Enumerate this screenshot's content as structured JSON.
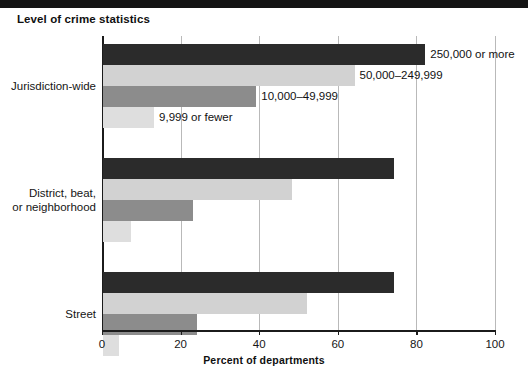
{
  "figure": {
    "title": "Level of crime statistics",
    "top_rule_color": "#141414"
  },
  "chart_data": {
    "type": "bar",
    "orientation": "horizontal",
    "title": "Level of crime statistics",
    "xlabel": "Percent of departments",
    "ylabel": "",
    "xlim": [
      0,
      100
    ],
    "xticks": [
      0,
      20,
      40,
      60,
      80,
      100
    ],
    "xticklabels": [
      "0",
      "20",
      "40",
      "60",
      "80",
      "100"
    ],
    "grid": "vertical",
    "legend_position": "inline-data-labels",
    "categories": [
      "Jurisdiction-wide",
      "District, beat, or neighborhood",
      "Street"
    ],
    "category_lines": [
      [
        "Jurisdiction-wide"
      ],
      [
        "District, beat,",
        "or neighborhood"
      ],
      [
        "Street"
      ]
    ],
    "series": [
      {
        "name": "250,000 or more",
        "color": "#2b2b2b",
        "values": [
          82,
          74,
          74
        ]
      },
      {
        "name": "50,000–249,999",
        "color": "#d2d2d2",
        "values": [
          64,
          48,
          52
        ]
      },
      {
        "name": "10,000–49,999",
        "color": "#8c8c8c",
        "values": [
          39,
          23,
          24
        ]
      },
      {
        "name": "9,999 or fewer",
        "color": "#dedede",
        "values": [
          13,
          7,
          4
        ]
      }
    ],
    "annotations": [
      {
        "text": "250,000 or more",
        "group": 0,
        "series": 0
      },
      {
        "text": "50,000–249,999",
        "group": 0,
        "series": 1
      },
      {
        "text": "10,000–49,999",
        "group": 0,
        "series": 2
      },
      {
        "text": "9,999 or fewer",
        "group": 0,
        "series": 3
      }
    ]
  }
}
